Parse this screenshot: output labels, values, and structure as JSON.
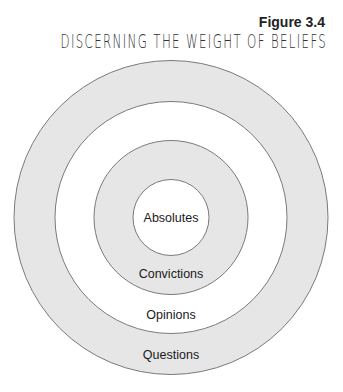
{
  "figure": {
    "number_label": "Figure 3.4",
    "title": "DISCERNING THE WEIGHT OF BELIEFS"
  },
  "colors": {
    "shaded_ring": "#e6e6e6",
    "unshaded_ring": "#ffffff",
    "stroke": "#7a7a7a",
    "text": "#1a1a1a"
  },
  "rings": [
    {
      "label": "Absolutes",
      "order": "innermost",
      "fill": "white"
    },
    {
      "label": "Convictions",
      "order": "second",
      "fill": "gray"
    },
    {
      "label": "Opinions",
      "order": "third",
      "fill": "white"
    },
    {
      "label": "Questions",
      "order": "outermost",
      "fill": "gray"
    }
  ]
}
